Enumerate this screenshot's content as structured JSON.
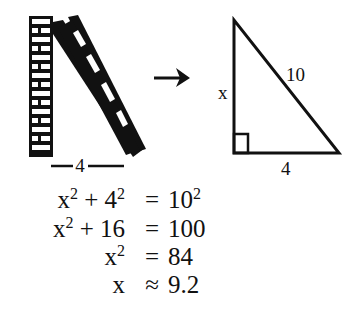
{
  "diagram": {
    "ladder_scene": {
      "wall_label": "brick wall",
      "ladder_label": "ladder",
      "base_distance_label": "4"
    },
    "arrow": "right-arrow",
    "triangle": {
      "vertical_side_label": "x",
      "hypotenuse_label": "10",
      "base_label": "4",
      "right_angle_marker": true
    }
  },
  "equations": [
    {
      "lhs_base1": "x",
      "lhs_exp1": "2",
      "lhs_mid": " + 4",
      "lhs_exp2": "2",
      "op": "=",
      "rhs_base": "10",
      "rhs_exp": "2"
    },
    {
      "lhs_base1": "x",
      "lhs_exp1": "2",
      "lhs_mid": " + 16",
      "lhs_exp2": "",
      "op": "=",
      "rhs_base": "100",
      "rhs_exp": ""
    },
    {
      "lhs_base1": "x",
      "lhs_exp1": "2",
      "lhs_mid": "",
      "lhs_exp2": "",
      "op": "=",
      "rhs_base": "84",
      "rhs_exp": ""
    },
    {
      "lhs_base1": "x",
      "lhs_exp1": "",
      "lhs_mid": "",
      "lhs_exp2": "",
      "op": "≈",
      "rhs_base": "9.2",
      "rhs_exp": ""
    }
  ]
}
